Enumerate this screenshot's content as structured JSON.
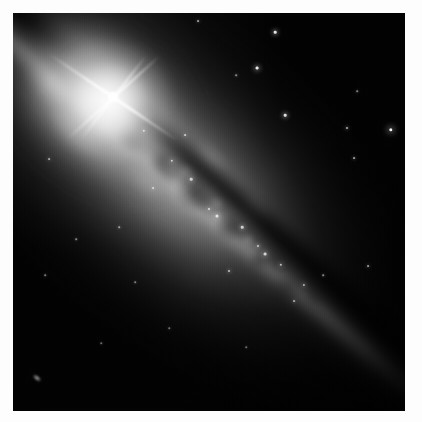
{
  "figure": {
    "kind": "astronomical-image",
    "caption": "",
    "border_color": "#fdfdfd",
    "sky_color": "#020202",
    "highlight_color": "#ffffff"
  },
  "plate": {
    "label": "image-plate",
    "width_px": 392,
    "height_px": 398,
    "offset_x_px": 13,
    "offset_y_px": 13
  },
  "galaxy": {
    "name": "",
    "disk_angle_deg": 41,
    "disk_label": "galactic disk",
    "dust_lane_label": "dust lane",
    "bulge_label": "central bulge",
    "halo_label": "stellar halo"
  },
  "bright_star": {
    "label": "foreground star with diffraction spikes",
    "x_px": 100,
    "y_px": 84,
    "spike_count": 4,
    "spike_lengths_px": [
      52,
      62,
      40,
      78
    ],
    "spike_angles_deg": [
      128,
      318,
      214,
      34
    ]
  },
  "background_galaxy": {
    "label": "background galaxy",
    "x_px": 24,
    "y_px": 365,
    "width_px": 9,
    "height_px": 4
  },
  "field_stars": [
    {
      "label": "field-star-1",
      "x_px": 262,
      "y_px": 19,
      "size_px": 2.6,
      "brightness": 0.9
    },
    {
      "label": "field-star-2",
      "x_px": 244,
      "y_px": 55,
      "size_px": 2.8,
      "brightness": 0.92
    },
    {
      "label": "field-star-3",
      "x_px": 272,
      "y_px": 102,
      "size_px": 2.6,
      "brightness": 0.88
    },
    {
      "label": "field-star-4",
      "x_px": 334,
      "y_px": 115,
      "size_px": 2.0,
      "brightness": 0.7
    },
    {
      "label": "field-star-5",
      "x_px": 378,
      "y_px": 117,
      "size_px": 3.4,
      "brightness": 0.97
    },
    {
      "label": "field-star-6",
      "x_px": 341,
      "y_px": 145,
      "size_px": 1.8,
      "brightness": 0.62
    },
    {
      "label": "field-star-7",
      "x_px": 344,
      "y_px": 78,
      "size_px": 1.6,
      "brightness": 0.5
    },
    {
      "label": "field-star-8",
      "x_px": 185,
      "y_px": 8,
      "size_px": 1.8,
      "brightness": 0.6
    },
    {
      "label": "field-star-9",
      "x_px": 223,
      "y_px": 62,
      "size_px": 1.6,
      "brightness": 0.52
    },
    {
      "label": "field-star-10",
      "x_px": 140,
      "y_px": 175,
      "size_px": 1.8,
      "brightness": 0.62
    },
    {
      "label": "field-star-11",
      "x_px": 106,
      "y_px": 214,
      "size_px": 1.6,
      "brightness": 0.55
    },
    {
      "label": "field-star-12",
      "x_px": 36,
      "y_px": 146,
      "size_px": 1.8,
      "brightness": 0.58
    },
    {
      "label": "field-star-13",
      "x_px": 63,
      "y_px": 226,
      "size_px": 1.6,
      "brightness": 0.5
    },
    {
      "label": "field-star-14",
      "x_px": 32,
      "y_px": 262,
      "size_px": 1.6,
      "brightness": 0.48
    },
    {
      "label": "field-star-15",
      "x_px": 122,
      "y_px": 269,
      "size_px": 1.6,
      "brightness": 0.46
    },
    {
      "label": "field-star-16",
      "x_px": 355,
      "y_px": 253,
      "size_px": 1.8,
      "brightness": 0.58
    },
    {
      "label": "field-star-17",
      "x_px": 245,
      "y_px": 233,
      "size_px": 2.0,
      "brightness": 0.72
    },
    {
      "label": "field-star-18",
      "x_px": 196,
      "y_px": 196,
      "size_px": 2.0,
      "brightness": 0.74
    },
    {
      "label": "field-star-19",
      "x_px": 216,
      "y_px": 258,
      "size_px": 2.0,
      "brightness": 0.7
    },
    {
      "label": "field-star-20",
      "x_px": 172,
      "y_px": 122,
      "size_px": 1.8,
      "brightness": 0.66
    },
    {
      "label": "field-star-21",
      "x_px": 281,
      "y_px": 288,
      "size_px": 1.8,
      "brightness": 0.58
    },
    {
      "label": "field-star-22",
      "x_px": 310,
      "y_px": 262,
      "size_px": 1.6,
      "brightness": 0.52
    },
    {
      "label": "field-star-23",
      "x_px": 156,
      "y_px": 315,
      "size_px": 1.5,
      "brightness": 0.42
    },
    {
      "label": "field-star-24",
      "x_px": 88,
      "y_px": 330,
      "size_px": 1.5,
      "brightness": 0.4
    },
    {
      "label": "field-star-25",
      "x_px": 233,
      "y_px": 334,
      "size_px": 1.5,
      "brightness": 0.4
    }
  ],
  "hii_knots": [
    {
      "label": "hii-knot-1",
      "x_px": 204,
      "y_px": 203,
      "size_px": 3.0,
      "brightness": 0.8
    },
    {
      "label": "hii-knot-2",
      "x_px": 229,
      "y_px": 214,
      "size_px": 2.6,
      "brightness": 0.74
    },
    {
      "label": "hii-knot-3",
      "x_px": 252,
      "y_px": 241,
      "size_px": 2.8,
      "brightness": 0.76
    },
    {
      "label": "hii-knot-4",
      "x_px": 268,
      "y_px": 252,
      "size_px": 2.4,
      "brightness": 0.7
    },
    {
      "label": "hii-knot-5",
      "x_px": 178,
      "y_px": 166,
      "size_px": 2.6,
      "brightness": 0.72
    },
    {
      "label": "hii-knot-6",
      "x_px": 159,
      "y_px": 148,
      "size_px": 2.4,
      "brightness": 0.7
    },
    {
      "label": "hii-knot-7",
      "x_px": 291,
      "y_px": 272,
      "size_px": 2.2,
      "brightness": 0.64
    },
    {
      "label": "hii-knot-8",
      "x_px": 131,
      "y_px": 118,
      "size_px": 2.4,
      "brightness": 0.68
    }
  ],
  "dust_clumps": [
    {
      "label": "dust-clump-1",
      "x_px": 118,
      "y_px": 128,
      "rx_px": 20,
      "ry_px": 9,
      "opacity": 0.52
    },
    {
      "label": "dust-clump-2",
      "x_px": 152,
      "y_px": 158,
      "rx_px": 17,
      "ry_px": 8,
      "opacity": 0.48
    },
    {
      "label": "dust-clump-3",
      "x_px": 188,
      "y_px": 188,
      "rx_px": 22,
      "ry_px": 10,
      "opacity": 0.5
    },
    {
      "label": "dust-clump-4",
      "x_px": 224,
      "y_px": 218,
      "rx_px": 18,
      "ry_px": 9,
      "opacity": 0.46
    },
    {
      "label": "dust-clump-5",
      "x_px": 262,
      "y_px": 250,
      "rx_px": 16,
      "ry_px": 8,
      "opacity": 0.42
    },
    {
      "label": "dust-clump-6",
      "x_px": 84,
      "y_px": 96,
      "rx_px": 18,
      "ry_px": 8,
      "opacity": 0.5
    },
    {
      "label": "dust-clump-7",
      "x_px": 52,
      "y_px": 62,
      "rx_px": 20,
      "ry_px": 9,
      "opacity": 0.54
    },
    {
      "label": "dust-clump-8",
      "x_px": 300,
      "y_px": 284,
      "rx_px": 14,
      "ry_px": 7,
      "opacity": 0.36
    }
  ],
  "bright_patches": [
    {
      "label": "bright-patch-1",
      "x_px": 66,
      "y_px": 118,
      "rx_px": 34,
      "ry_px": 18,
      "opacity": 0.34
    },
    {
      "label": "bright-patch-2",
      "x_px": 132,
      "y_px": 168,
      "rx_px": 26,
      "ry_px": 14,
      "opacity": 0.24
    },
    {
      "label": "bright-patch-3",
      "x_px": 36,
      "y_px": 72,
      "rx_px": 28,
      "ry_px": 16,
      "opacity": 0.3
    },
    {
      "label": "bright-patch-4",
      "x_px": 196,
      "y_px": 146,
      "rx_px": 22,
      "ry_px": 12,
      "opacity": 0.2
    },
    {
      "label": "bright-patch-5",
      "x_px": 240,
      "y_px": 196,
      "rx_px": 20,
      "ry_px": 11,
      "opacity": 0.17
    }
  ]
}
